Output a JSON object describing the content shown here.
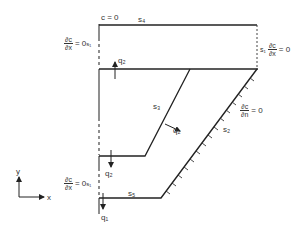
{
  "diagram": {
    "type": "boundary-value domain sketch",
    "boundaries": {
      "s1": "s₁",
      "s2": "s₂",
      "s3": "s₃",
      "s4": "s₄",
      "s5": "s₅"
    },
    "conditions": {
      "top": "c = 0",
      "left_upper_num": "∂c",
      "left_upper_den": "∂x",
      "left_upper_eq": "= 0",
      "left_upper_s": "s₁",
      "left_lower_num": "∂c",
      "left_lower_den": "∂x",
      "left_lower_eq": "= 0",
      "left_lower_s": "s₁",
      "right_s": "s₁",
      "right_num": "∂c",
      "right_den": "∂x",
      "right_eq": "= 0",
      "normal_num": "∂c",
      "normal_den": "∂n",
      "normal_eq": "= 0"
    },
    "fluxes": {
      "q2_up": "q₂",
      "q2_diag": "q₂",
      "q2_down": "q₂",
      "q1": "q₁"
    },
    "axes": {
      "x": "x",
      "y": "y"
    }
  }
}
